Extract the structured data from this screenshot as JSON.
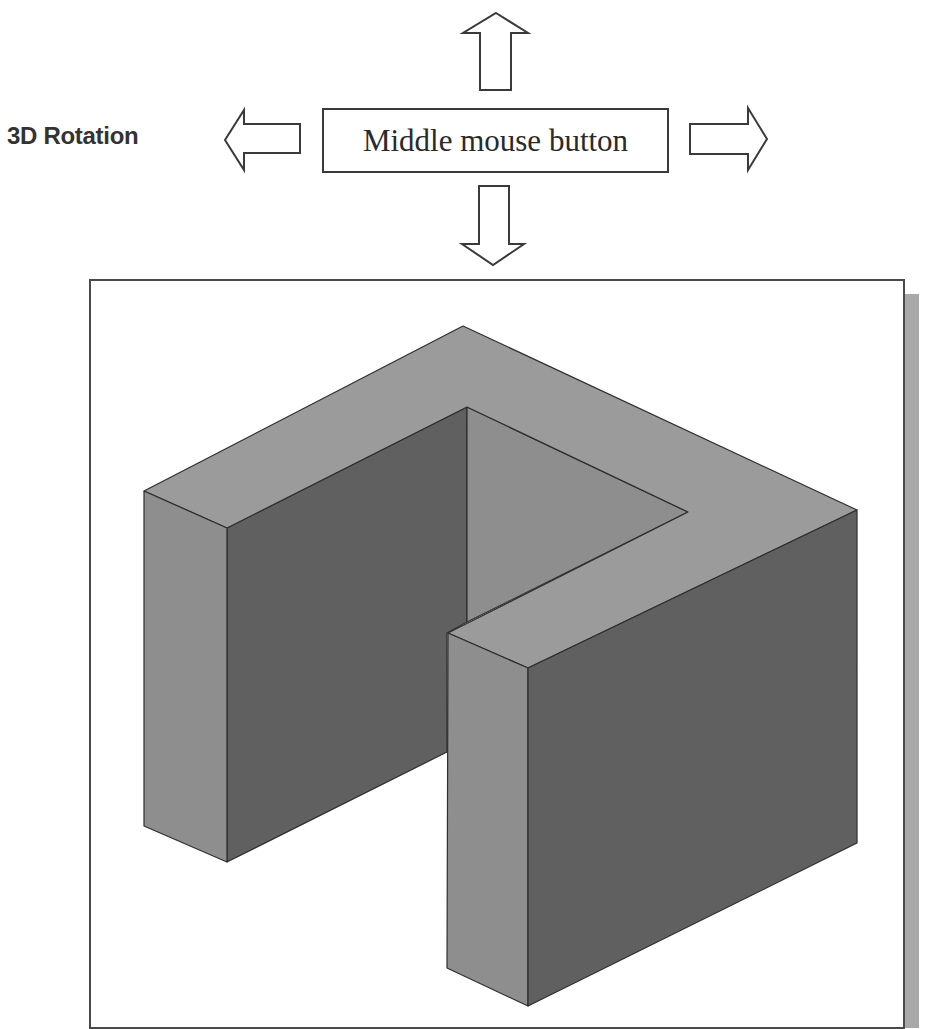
{
  "header": {
    "title": "3D Rotation",
    "control_label": "Middle mouse button"
  },
  "arrows": [
    {
      "direction": "up"
    },
    {
      "direction": "down"
    },
    {
      "direction": "left"
    },
    {
      "direction": "right"
    }
  ],
  "viewport": {
    "model": "U-shaped block (isometric view)",
    "colors": {
      "top_face": "#9b9b9b",
      "left_face": "#8e8e8e",
      "right_face": "#606060",
      "edge": "#2e2e2e",
      "frame": "#4a4a4a",
      "shadow": "#a8a8a8"
    }
  }
}
